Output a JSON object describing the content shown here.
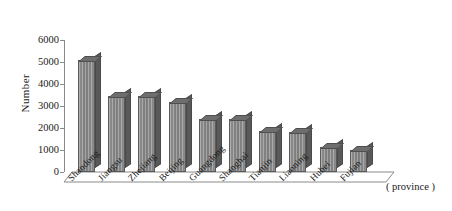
{
  "chart_data": {
    "type": "bar",
    "title": "",
    "xlabel": "( province )",
    "ylabel": "Number",
    "ylim": [
      0,
      6000
    ],
    "yticks": [
      0,
      1000,
      2000,
      3000,
      4000,
      5000,
      6000
    ],
    "ytick_labels": [
      "0",
      "1000",
      "2000",
      "3000",
      "4000",
      "5000",
      "6000"
    ],
    "grid": false,
    "legend": "none",
    "style": "3d-bar",
    "bar_color": "#7c7c7c",
    "bar_side_color": "#595959",
    "axis_color": "#8a8a8a",
    "categories": [
      "Shandong",
      "Jiangsu",
      "Zhejiang",
      "Beijing",
      "Guangdong",
      "Shanghai",
      "Tianjin",
      "Liaoning",
      "Hubei",
      "Fujian"
    ],
    "values": [
      5100,
      3450,
      3450,
      3200,
      2400,
      2400,
      1850,
      1800,
      1150,
      1000
    ]
  }
}
